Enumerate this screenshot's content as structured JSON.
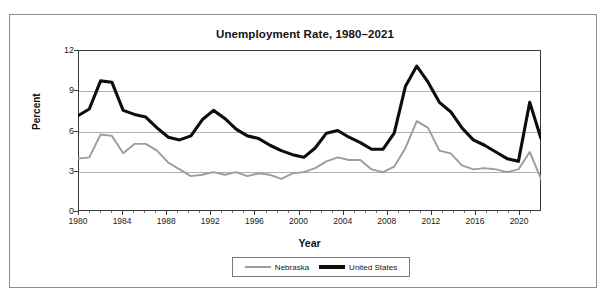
{
  "scan_artifact_text": "",
  "chart_title": "Unemployment Rate, 1980–2021",
  "axes": {
    "y_title": "Percent",
    "x_title": "Year",
    "y_ticks": [
      "0",
      "3",
      "6",
      "9",
      "12"
    ],
    "x_ticks": [
      "1980",
      "1984",
      "1988",
      "1992",
      "1996",
      "2000",
      "2004",
      "2008",
      "2012",
      "2016",
      "2020"
    ]
  },
  "legend": {
    "items": [
      {
        "label": "Nebraska",
        "color": "#9c9c9c"
      },
      {
        "label": "United States",
        "color": "#0d0d0d"
      }
    ]
  },
  "colors": {
    "nebraska": "#9c9c9c",
    "united_states": "#0d0d0d",
    "gridline": "#b0b0b0",
    "axis": "#3a3a3a",
    "frame": "#8d8d8d"
  },
  "chart_data": {
    "type": "line",
    "title": "Unemployment Rate, 1980–2021",
    "xlabel": "Year",
    "ylabel": "Percent",
    "xlim": [
      1980,
      2021
    ],
    "ylim": [
      0,
      12
    ],
    "ytick_values": [
      0,
      3,
      6,
      9,
      12
    ],
    "xtick_values": [
      1980,
      1984,
      1988,
      1992,
      1996,
      2000,
      2004,
      2008,
      2012,
      2016,
      2020
    ],
    "grid": "horizontal",
    "legend_position": "bottom",
    "x": [
      1980,
      1981,
      1982,
      1983,
      1984,
      1985,
      1986,
      1987,
      1988,
      1989,
      1990,
      1991,
      1992,
      1993,
      1994,
      1995,
      1996,
      1997,
      1998,
      1999,
      2000,
      2001,
      2002,
      2003,
      2004,
      2005,
      2006,
      2007,
      2008,
      2009,
      2010,
      2011,
      2012,
      2013,
      2014,
      2015,
      2016,
      2017,
      2018,
      2019,
      2020,
      2021
    ],
    "series": [
      {
        "name": "Nebraska",
        "color": "#9c9c9c",
        "values": [
          3.9,
          4.0,
          5.7,
          5.6,
          4.3,
          5.0,
          5.0,
          4.5,
          3.6,
          3.1,
          2.6,
          2.7,
          2.9,
          2.7,
          2.9,
          2.6,
          2.8,
          2.7,
          2.4,
          2.8,
          2.9,
          3.2,
          3.7,
          4.0,
          3.8,
          3.8,
          3.1,
          2.9,
          3.3,
          4.7,
          6.7,
          6.2,
          4.5,
          4.3,
          3.4,
          3.1,
          3.2,
          3.1,
          2.9,
          3.1,
          4.4,
          2.4
        ]
      },
      {
        "name": "United States",
        "color": "#0d0d0d",
        "values": [
          7.1,
          7.6,
          9.7,
          9.6,
          7.5,
          7.2,
          7.0,
          6.2,
          5.5,
          5.3,
          5.6,
          6.8,
          7.5,
          6.9,
          6.1,
          5.6,
          5.4,
          4.9,
          4.5,
          4.2,
          4.0,
          4.7,
          5.8,
          6.0,
          5.5,
          5.1,
          4.6,
          4.6,
          5.8,
          9.3,
          10.8,
          9.6,
          8.1,
          7.4,
          6.2,
          5.3,
          4.9,
          4.4,
          3.9,
          3.7,
          8.1,
          5.4
        ]
      }
    ]
  }
}
